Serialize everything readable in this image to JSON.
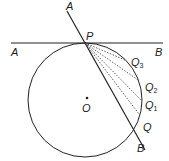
{
  "diagram": {
    "colors": {
      "stroke": "#222222",
      "background": "#ffffff"
    },
    "circle": {
      "cx": 85,
      "cy": 100,
      "r": 57
    },
    "tangent_line": {
      "x1": 11,
      "y1": 43,
      "x2": 163,
      "y2": 43
    },
    "secant_line": {
      "x1": 67,
      "y1": 11,
      "x2": 145,
      "y2": 150
    },
    "labels": {
      "A_top": "A",
      "A_left": "A",
      "P": "P",
      "B_right": "B",
      "Q3": "Q",
      "Q3_sub": "3",
      "Q2": "Q",
      "Q2_sub": "2",
      "Q1": "Q",
      "Q1_sub": "1",
      "Q": "Q",
      "B_bottom": "B",
      "O": "O"
    },
    "points": {
      "P": [
        85,
        43
      ],
      "Q3": [
        125,
        60
      ],
      "Q2": [
        138,
        80
      ],
      "Q1": [
        141,
        100
      ],
      "Q": [
        134,
        129
      ],
      "O": [
        87,
        100
      ]
    }
  }
}
